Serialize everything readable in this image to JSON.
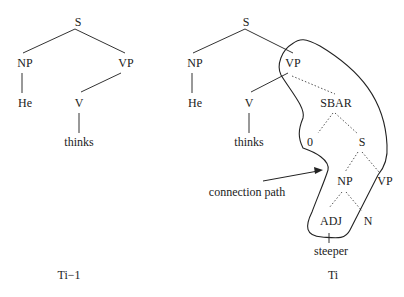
{
  "left_tree": {
    "caption": "Ti−1",
    "nodes": {
      "s": "S",
      "np": "NP",
      "vp": "VP",
      "he": "He",
      "v": "V",
      "thinks": "thinks"
    }
  },
  "right_tree": {
    "caption": "Ti",
    "nodes": {
      "s": "S",
      "np": "NP",
      "vp": "VP",
      "he": "He",
      "v": "V",
      "thinks": "thinks",
      "sbar": "SBAR",
      "zero": "0",
      "s2": "S",
      "np2": "NP",
      "vp2": "VP",
      "adj": "ADJ",
      "n": "N",
      "steeper": "steeper"
    },
    "annotation": "connection path"
  }
}
